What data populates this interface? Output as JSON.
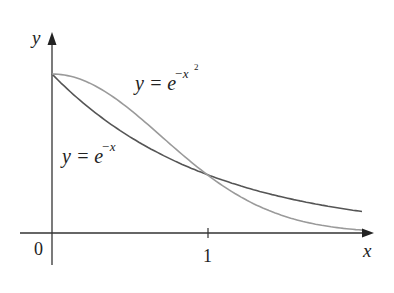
{
  "chart_data": {
    "type": "line",
    "title": "",
    "xlabel": "x",
    "ylabel": "y",
    "x_ticks": [
      "0",
      "1"
    ],
    "xlim": [
      0,
      2
    ],
    "ylim": [
      0,
      1
    ],
    "grid": false,
    "legend": "inline annotations",
    "series": [
      {
        "name": "y = e^{-x}",
        "color": "#555555",
        "x": [
          0,
          0.25,
          0.5,
          0.75,
          1,
          1.25,
          1.5,
          1.75,
          2
        ],
        "values": [
          1,
          0.779,
          0.607,
          0.472,
          0.368,
          0.287,
          0.223,
          0.174,
          0.135
        ]
      },
      {
        "name": "y = e^{-x^2}",
        "color": "#9a9a9a",
        "x": [
          0,
          0.25,
          0.5,
          0.75,
          1,
          1.25,
          1.5,
          1.75,
          2
        ],
        "values": [
          1,
          0.939,
          0.779,
          0.57,
          0.368,
          0.21,
          0.105,
          0.047,
          0.018
        ]
      }
    ],
    "annotations": [
      {
        "text_base": "y = e",
        "sup": "−x",
        "series": "y = e^{-x}"
      },
      {
        "text_base": "y = e",
        "sup": "−x",
        "sup2": "2",
        "series": "y = e^{-x^2}"
      }
    ]
  },
  "labels": {
    "y_axis": "y",
    "x_axis": "x",
    "origin": "0",
    "tick_one": "1",
    "ann1_base": "y = e",
    "ann1_sup": "−x",
    "ann2_base": "y = e",
    "ann2_sup": "−x",
    "ann2_sup2": "2"
  }
}
